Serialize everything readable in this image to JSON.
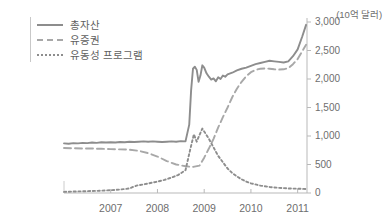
{
  "chart_data": {
    "type": "line",
    "title": "",
    "subtitle": "",
    "unit_label": "(10억 달러)",
    "xlabel": "",
    "ylabel": "",
    "ylim": [
      0,
      3000
    ],
    "xlim": [
      2006.0,
      2011.2
    ],
    "grid": false,
    "legend_position": "top-left",
    "y_ticks": [
      "0",
      "500",
      "1,000",
      "1,500",
      "2,000",
      "2,500",
      "3,000"
    ],
    "y_tick_values": [
      0,
      500,
      1000,
      1500,
      2000,
      2500,
      3000
    ],
    "x_ticks": [
      "2007",
      "2008",
      "2009",
      "2010",
      "2011"
    ],
    "x_tick_values": [
      2007,
      2008,
      2009,
      2010,
      2011
    ],
    "series": [
      {
        "name": "총자산",
        "style": "solid",
        "color": "#8d8d8d",
        "x": [
          2006.0,
          2006.1,
          2006.2,
          2006.3,
          2006.4,
          2006.5,
          2006.6,
          2006.7,
          2006.8,
          2006.9,
          2007.0,
          2007.1,
          2007.2,
          2007.3,
          2007.4,
          2007.5,
          2007.6,
          2007.7,
          2007.8,
          2007.9,
          2008.0,
          2008.1,
          2008.2,
          2008.3,
          2008.4,
          2008.5,
          2008.6,
          2008.68,
          2008.72,
          2008.76,
          2008.8,
          2008.84,
          2008.88,
          2008.92,
          2008.96,
          2009.0,
          2009.05,
          2009.1,
          2009.15,
          2009.2,
          2009.25,
          2009.3,
          2009.35,
          2009.4,
          2009.45,
          2009.5,
          2009.6,
          2009.7,
          2009.8,
          2009.9,
          2010.0,
          2010.1,
          2010.2,
          2010.3,
          2010.4,
          2010.5,
          2010.6,
          2010.7,
          2010.8,
          2010.9,
          2011.0,
          2011.1,
          2011.18
        ],
        "y": [
          870,
          865,
          875,
          870,
          880,
          875,
          885,
          880,
          890,
          885,
          890,
          885,
          895,
          890,
          900,
          895,
          900,
          905,
          900,
          905,
          900,
          895,
          900,
          905,
          900,
          910,
          905,
          1200,
          1800,
          2180,
          2215,
          2160,
          1950,
          2060,
          2240,
          2200,
          2100,
          2040,
          1990,
          2010,
          1960,
          2030,
          2000,
          2060,
          2040,
          2080,
          2110,
          2150,
          2180,
          2200,
          2230,
          2260,
          2280,
          2300,
          2320,
          2310,
          2300,
          2290,
          2310,
          2400,
          2520,
          2750,
          2950
        ]
      },
      {
        "name": "유증권",
        "style": "dashed",
        "color": "#a8a8a8",
        "x": [
          2006.0,
          2006.2,
          2006.4,
          2006.6,
          2006.8,
          2007.0,
          2007.2,
          2007.4,
          2007.6,
          2007.8,
          2008.0,
          2008.2,
          2008.4,
          2008.6,
          2008.75,
          2008.9,
          2009.0,
          2009.1,
          2009.2,
          2009.3,
          2009.4,
          2009.5,
          2009.6,
          2009.7,
          2009.8,
          2009.9,
          2010.0,
          2010.1,
          2010.2,
          2010.3,
          2010.4,
          2010.5,
          2010.6,
          2010.7,
          2010.8,
          2010.9,
          2011.0,
          2011.1,
          2011.18
        ],
        "y": [
          790,
          785,
          780,
          780,
          775,
          770,
          765,
          760,
          740,
          700,
          640,
          560,
          500,
          470,
          455,
          480,
          620,
          780,
          950,
          1150,
          1330,
          1500,
          1680,
          1830,
          1950,
          2050,
          2120,
          2160,
          2180,
          2185,
          2180,
          2170,
          2165,
          2170,
          2190,
          2260,
          2350,
          2490,
          2600
        ]
      },
      {
        "name": "유동성 프로그램",
        "style": "dotted",
        "color": "#8d8d8d",
        "x": [
          2006.0,
          2006.2,
          2006.4,
          2006.6,
          2006.8,
          2007.0,
          2007.2,
          2007.4,
          2007.55,
          2007.7,
          2007.85,
          2008.0,
          2008.15,
          2008.3,
          2008.45,
          2008.6,
          2008.7,
          2008.78,
          2008.84,
          2008.9,
          2008.96,
          2009.0,
          2009.1,
          2009.2,
          2009.3,
          2009.4,
          2009.5,
          2009.6,
          2009.7,
          2009.8,
          2009.9,
          2010.0,
          2010.2,
          2010.4,
          2010.6,
          2010.8,
          2011.0,
          2011.18
        ],
        "y": [
          20,
          25,
          30,
          35,
          40,
          50,
          60,
          80,
          130,
          150,
          175,
          200,
          230,
          270,
          320,
          400,
          760,
          1030,
          900,
          1020,
          1130,
          1080,
          950,
          800,
          650,
          540,
          430,
          350,
          290,
          240,
          200,
          170,
          130,
          105,
          90,
          80,
          75,
          70
        ]
      }
    ]
  },
  "legend": {
    "items": [
      {
        "label": "총자산"
      },
      {
        "label": "유증권"
      },
      {
        "label": "유동성 프로그램"
      }
    ]
  }
}
